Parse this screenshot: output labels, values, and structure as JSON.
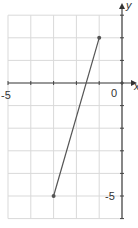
{
  "chart_data": {
    "type": "line",
    "title": "",
    "xlabel": "x",
    "ylabel": "y",
    "xlim": [
      -5.3,
      0.7
    ],
    "ylim": [
      -6,
      3.2
    ],
    "grid": true,
    "tick_labels": {
      "x": [
        "-5",
        "0"
      ],
      "y": [
        "-5"
      ]
    },
    "series": [
      {
        "name": "segment",
        "points": [
          {
            "x": -3,
            "y": -5
          },
          {
            "x": -1,
            "y": 2
          }
        ],
        "color": "#555555"
      }
    ]
  },
  "labels": {
    "x_min": "-5",
    "origin": "0",
    "y_min": "-5",
    "x_axis": "x",
    "y_axis": "y"
  }
}
